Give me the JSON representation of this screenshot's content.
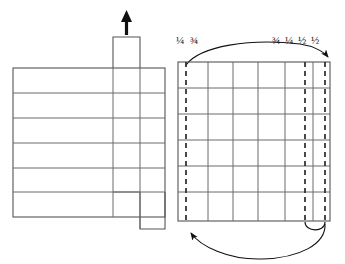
{
  "figure": {
    "canvas": {
      "width": 345,
      "height": 264,
      "background": "#ffffff"
    },
    "stroke_colors": {
      "solid_line": "#6b6b6b",
      "outline": "#555555",
      "dashed_line": "#2a2a2a",
      "arrow": "#111111",
      "text": "#1a1a1a"
    }
  },
  "labels": {
    "left_group": {
      "text": "¼  ¾",
      "items": [
        "¼",
        "¾"
      ],
      "x": 176,
      "y": 44
    },
    "right_group": {
      "text": "¾  ¼ ½ ½",
      "items": [
        "¾",
        "¼",
        "½",
        "½"
      ],
      "x": 272,
      "y": 44
    }
  },
  "left_panel": {
    "name": "left-piece-diagram",
    "body_rect": {
      "x": 13,
      "y": 68,
      "width": 152,
      "height": 149
    },
    "row_lines_y": [
      93,
      118,
      143,
      168,
      192
    ],
    "row_count": 6,
    "interior_vertical_lines_x": [
      113,
      140
    ],
    "tab_rect": {
      "x": 113,
      "y": 37,
      "width": 27,
      "height": 31
    },
    "lower_tab_rect": {
      "x": 140,
      "y": 192,
      "width": 25,
      "height": 37
    },
    "notch_line": {
      "x1": 113,
      "y1": 192,
      "x2": 140,
      "y2": 192
    },
    "up_arrow": {
      "name": "grain-direction-arrow",
      "x": 126,
      "y_top": 11,
      "y_bottom": 35,
      "direction": "up"
    }
  },
  "right_panel": {
    "name": "right-piece-diagram",
    "body_rect": {
      "x": 178,
      "y": 62,
      "width": 152,
      "height": 159
    },
    "row_lines_y": [
      88,
      114,
      140,
      166,
      192
    ],
    "row_count": 6,
    "solid_vertical_lines_x": [
      208,
      233,
      258,
      285,
      313
    ],
    "dashed_vertical_lines_x": [
      186,
      305,
      325
    ],
    "top_arc": {
      "name": "top-direction-arc",
      "start_x": 186,
      "start_y": 64,
      "end_x": 329,
      "end_y": 60,
      "peak_y": 44,
      "arrowhead": "end",
      "direction": "left-to-right"
    },
    "bottom_arc": {
      "name": "bottom-direction-arc",
      "start_x": 322,
      "start_y": 222,
      "end_x": 188,
      "end_y": 226,
      "trough_y": 258,
      "arrowhead": "end",
      "direction": "right-to-left"
    },
    "bottom_hook": {
      "name": "bottom-hook-curve",
      "x1": 305,
      "x2": 325,
      "y": 222,
      "depth": 10
    }
  }
}
